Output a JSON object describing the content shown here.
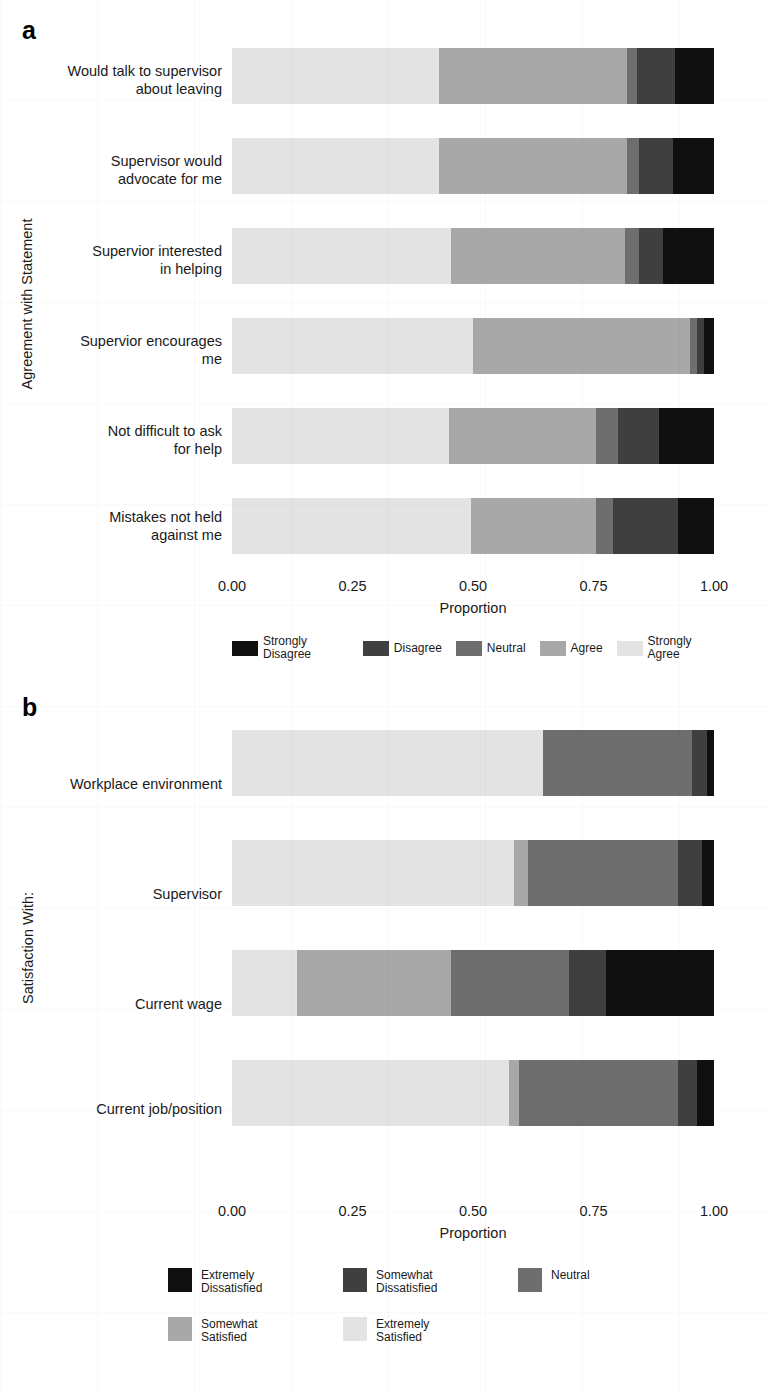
{
  "figure": {
    "panels": [
      {
        "letter": "a",
        "y_axis_title": "Agreement with Statement",
        "x_axis_title": "Proportion"
      },
      {
        "letter": "b",
        "y_axis_title": "Satisfaction With:",
        "x_axis_title": "Proportion"
      }
    ]
  },
  "colors": {
    "strongly_disagree": "#101010",
    "disagree": "#3f3f3f",
    "neutral": "#6e6e6e",
    "agree": "#a8a8a8",
    "strongly_agree": "#e3e3e3",
    "extremely_dissatisfied": "#101010",
    "somewhat_dissatisfied": "#3f3f3f",
    "neutral_b": "#6e6e6e",
    "somewhat_satisfied": "#a8a8a8",
    "extremely_satisfied": "#e3e3e3",
    "text": "#1a1a1a",
    "axis": "#4d4d4d"
  },
  "panel_a": {
    "letter": "a",
    "legend": [
      {
        "label": "Strongly Disagree",
        "color": "#101010"
      },
      {
        "label": "Disagree",
        "color": "#3f3f3f"
      },
      {
        "label": "Neutral",
        "color": "#6e6e6e"
      },
      {
        "label": "Agree",
        "color": "#a8a8a8"
      },
      {
        "label": "Strongly Agree",
        "color": "#e3e3e3"
      }
    ],
    "ticks": [
      "0.00",
      "0.25",
      "0.50",
      "0.75",
      "1.00"
    ],
    "categories": [
      "Would talk to supervisor\nabout leaving",
      "Supervisor would\nadvocate for me",
      "Supervior interested\nin helping",
      "Supervior encourages\nme",
      "Not difficult to ask\nfor help",
      "Mistakes not held\nagainst me"
    ]
  },
  "panel_b": {
    "letter": "b",
    "legend_rows": [
      [
        {
          "label": "Extremely\nDissatisfied",
          "color": "#101010"
        },
        {
          "label": "Somewhat\nDissatisfied",
          "color": "#3f3f3f"
        },
        {
          "label": "Neutral",
          "color": "#6e6e6e"
        }
      ],
      [
        {
          "label": "Somewhat\nSatisfied",
          "color": "#a8a8a8"
        },
        {
          "label": "Extremely\nSatisfied",
          "color": "#e3e3e3"
        }
      ]
    ],
    "ticks": [
      "0.00",
      "0.25",
      "0.50",
      "0.75",
      "1.00"
    ],
    "categories": [
      "Workplace environment",
      "Supervisor",
      "Current wage",
      "Current job/position"
    ]
  },
  "chart_data": [
    {
      "type": "bar",
      "orientation": "horizontal",
      "stacked": true,
      "normalized": true,
      "panel": "a",
      "title": "",
      "xlabel": "Proportion",
      "ylabel": "Agreement with Statement",
      "xlim": [
        0,
        1
      ],
      "xticks": [
        0.0,
        0.25,
        0.5,
        0.75,
        1.0
      ],
      "grid": false,
      "legend_position": "bottom",
      "categories": [
        "Would talk to supervisor about leaving",
        "Supervisor would advocate for me",
        "Supervior interested in helping",
        "Supervior encourages me",
        "Not difficult to ask for help",
        "Mistakes not held against me"
      ],
      "series": [
        {
          "name": "Strongly Agree",
          "color": "#e3e3e3",
          "values": [
            0.43,
            0.43,
            0.455,
            0.5,
            0.45,
            0.495
          ]
        },
        {
          "name": "Agree",
          "color": "#a8a8a8",
          "values": [
            0.39,
            0.39,
            0.36,
            0.45,
            0.305,
            0.26
          ]
        },
        {
          "name": "Neutral",
          "color": "#6e6e6e",
          "values": [
            0.02,
            0.025,
            0.03,
            0.015,
            0.045,
            0.035
          ]
        },
        {
          "name": "Disagree",
          "color": "#3f3f3f",
          "values": [
            0.08,
            0.07,
            0.05,
            0.015,
            0.085,
            0.135
          ]
        },
        {
          "name": "Strongly Disagree",
          "color": "#101010",
          "values": [
            0.08,
            0.085,
            0.105,
            0.02,
            0.115,
            0.075
          ]
        }
      ]
    },
    {
      "type": "bar",
      "orientation": "horizontal",
      "stacked": true,
      "normalized": true,
      "panel": "b",
      "title": "",
      "xlabel": "Proportion",
      "ylabel": "Satisfaction With:",
      "xlim": [
        0,
        1
      ],
      "xticks": [
        0.0,
        0.25,
        0.5,
        0.75,
        1.0
      ],
      "grid": false,
      "legend_position": "bottom",
      "categories": [
        "Workplace environment",
        "Supervisor",
        "Current wage",
        "Current job/position"
      ],
      "series": [
        {
          "name": "Extremely Satisfied",
          "color": "#e3e3e3",
          "values": [
            0.645,
            0.585,
            0.135,
            0.575
          ]
        },
        {
          "name": "Somewhat Satisfied",
          "color": "#a8a8a8",
          "values": [
            0.0,
            0.03,
            0.32,
            0.02
          ]
        },
        {
          "name": "Neutral",
          "color": "#6e6e6e",
          "values": [
            0.31,
            0.31,
            0.245,
            0.33
          ]
        },
        {
          "name": "Somewhat Dissatisfied",
          "color": "#3f3f3f",
          "values": [
            0.03,
            0.05,
            0.075,
            0.04
          ]
        },
        {
          "name": "Extremely Dissatisfied",
          "color": "#101010",
          "values": [
            0.015,
            0.025,
            0.225,
            0.035
          ]
        }
      ]
    }
  ]
}
